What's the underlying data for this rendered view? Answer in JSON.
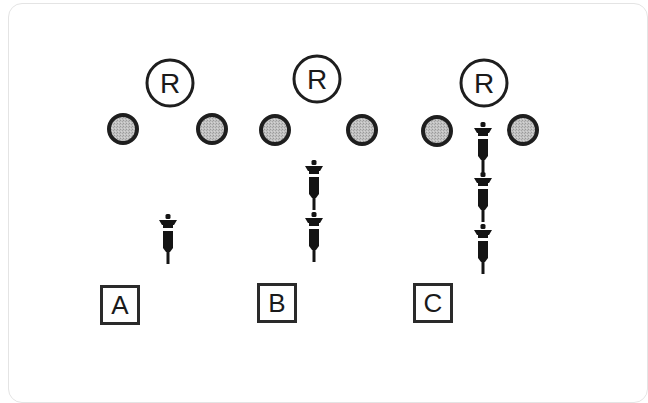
{
  "colors": {
    "stroke": "#1e1e1e",
    "neutral_fill": "#b9b9b9",
    "syringe": "#141414",
    "background": "#ffffff",
    "frame": "#e4e4e4"
  },
  "panels": [
    {
      "label": "A",
      "label_box": {
        "x": 100,
        "y": 285
      },
      "reference": {
        "text": "R",
        "cx": 170,
        "cy": 83,
        "r": 23
      },
      "neutral_circles": [
        {
          "cx": 123,
          "cy": 129,
          "r": 14
        },
        {
          "cx": 212,
          "cy": 129,
          "r": 14
        }
      ],
      "syringes": [
        {
          "cx": 168,
          "tip_y": 214
        }
      ]
    },
    {
      "label": "B",
      "label_box": {
        "x": 257,
        "y": 283
      },
      "reference": {
        "text": "R",
        "cx": 317,
        "cy": 79,
        "r": 23
      },
      "neutral_circles": [
        {
          "cx": 275,
          "cy": 130,
          "r": 14
        },
        {
          "cx": 362,
          "cy": 130,
          "r": 14
        }
      ],
      "syringes": [
        {
          "cx": 314,
          "tip_y": 160
        },
        {
          "cx": 314,
          "tip_y": 212
        }
      ]
    },
    {
      "label": "C",
      "label_box": {
        "x": 413,
        "y": 283
      },
      "reference": {
        "text": "R",
        "cx": 484,
        "cy": 83,
        "r": 23
      },
      "neutral_circles": [
        {
          "cx": 437,
          "cy": 131,
          "r": 14
        },
        {
          "cx": 523,
          "cy": 130,
          "r": 14
        }
      ],
      "syringes": [
        {
          "cx": 483,
          "tip_y": 122
        },
        {
          "cx": 483,
          "tip_y": 172
        },
        {
          "cx": 483,
          "tip_y": 224
        }
      ]
    }
  ]
}
